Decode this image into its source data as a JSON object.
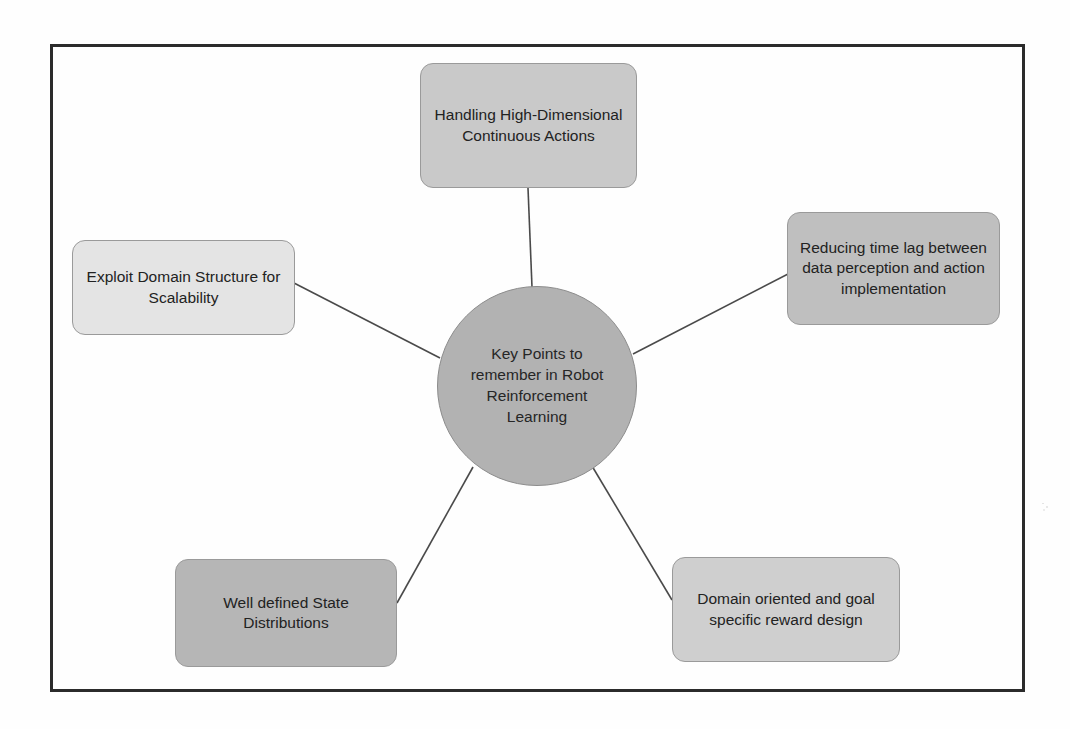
{
  "diagram": {
    "title": "Key Points to remember in Robot Reinforcement Learning",
    "hub": {
      "label": "Key Points to remember in Robot Reinforcement Learning",
      "fill": "#b2b2b2",
      "shape": "circle"
    },
    "nodes": [
      {
        "id": "handling-high-dimensional-continuous-actions",
        "label": "Handling High-Dimensional Continuous Actions",
        "position": "top",
        "fill": "#c9c9c9"
      },
      {
        "id": "reducing-time-lag",
        "label": "Reducing time lag between data perception and action implementation",
        "position": "right",
        "fill": "#bfbfbf"
      },
      {
        "id": "exploit-domain-structure",
        "label": "Exploit Domain Structure for Scalability",
        "position": "left",
        "fill": "#e4e4e4"
      },
      {
        "id": "well-defined-state-distributions",
        "label": "Well defined State Distributions",
        "position": "bottom-left",
        "fill": "#b6b6b6"
      },
      {
        "id": "domain-oriented-reward-design",
        "label": "Domain oriented and goal specific reward design",
        "position": "bottom-right",
        "fill": "#cfcfcf"
      }
    ],
    "connectors": [
      {
        "from": "hub",
        "to": "handling-high-dimensional-continuous-actions"
      },
      {
        "from": "hub",
        "to": "reducing-time-lag"
      },
      {
        "from": "hub",
        "to": "exploit-domain-structure"
      },
      {
        "from": "hub",
        "to": "well-defined-state-distributions"
      },
      {
        "from": "hub",
        "to": "domain-oriented-reward-design"
      }
    ],
    "frame": {
      "border_color": "#2b2b2b",
      "background": "#ffffff"
    }
  }
}
